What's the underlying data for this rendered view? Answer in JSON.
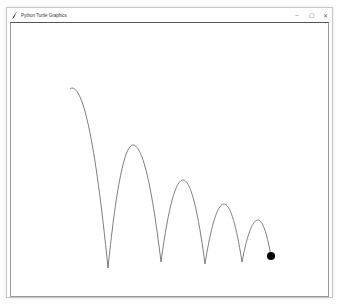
{
  "window": {
    "title": "Python Turtle Graphics",
    "app_icon": "feather-icon",
    "controls": {
      "minimize": "–",
      "maximize": "☐",
      "close": "✕"
    }
  },
  "canvas": {
    "background": "#ffffff",
    "trail_color": "#6e6e6e",
    "ball_color": "#000000",
    "ball": {
      "x": 271,
      "y": 256,
      "radius": 4
    },
    "trajectory": {
      "start": {
        "x": 70,
        "y": 89
      },
      "bounces": [
        {
          "x": 108,
          "y": 268
        },
        {
          "x": 161,
          "y": 262
        },
        {
          "x": 205,
          "y": 264
        },
        {
          "x": 242,
          "y": 262
        }
      ],
      "peaks": [
        {
          "x": 72,
          "y": 88
        },
        {
          "x": 133,
          "y": 145
        },
        {
          "x": 183,
          "y": 180
        },
        {
          "x": 224,
          "y": 204
        },
        {
          "x": 258,
          "y": 220
        }
      ]
    }
  }
}
